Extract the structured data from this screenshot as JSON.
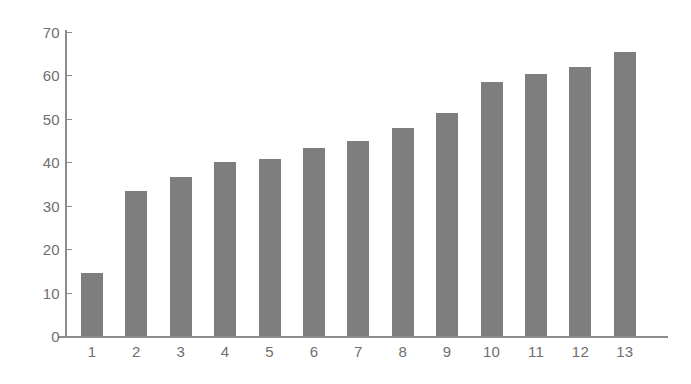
{
  "chart_data": {
    "type": "bar",
    "title": "",
    "subtitle": "",
    "xlabel": "",
    "ylabel": "",
    "categories": [
      "1",
      "2",
      "3",
      "4",
      "5",
      "6",
      "7",
      "8",
      "9",
      "10",
      "11",
      "12",
      "13"
    ],
    "values": [
      14.6,
      33.3,
      36.7,
      40.0,
      40.8,
      43.3,
      44.9,
      48.0,
      51.4,
      58.5,
      60.4,
      62.0,
      65.5
    ],
    "ylim": [
      0,
      70
    ],
    "yticks": [
      0,
      10,
      20,
      30,
      40,
      50,
      60,
      70
    ],
    "ytick_labels": [
      "0",
      "10",
      "20",
      "30",
      "40",
      "50",
      "60",
      "70"
    ],
    "grid": false,
    "legend": null,
    "legend_position": "none",
    "annotations": [],
    "series": [
      {
        "name": "series-1",
        "values": [
          14.6,
          33.3,
          36.7,
          40.0,
          40.8,
          43.3,
          44.9,
          48.0,
          51.4,
          58.5,
          60.4,
          62.0,
          65.5
        ]
      }
    ]
  },
  "colors": {
    "bar_fill": "#7e7e7e",
    "axis": "#8d8d8d",
    "tick_text": "#6f6f6f",
    "background": "#ffffff"
  }
}
